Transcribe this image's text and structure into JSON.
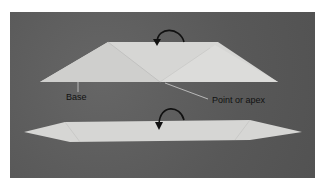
{
  "figure": {
    "labels": {
      "base": "Base",
      "apex": "Point or apex"
    },
    "colors": {
      "background": "#5e5e5e",
      "paper": "#d8d8d6",
      "arrow": "#111111"
    }
  }
}
